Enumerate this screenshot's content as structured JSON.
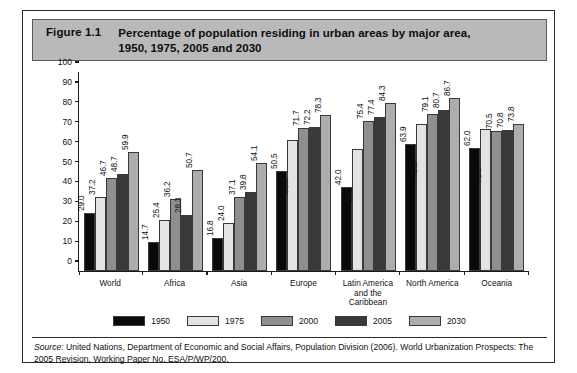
{
  "figure": {
    "number": "Figure 1.1",
    "title_line1": "Percentage of population residing in urban areas by major area,",
    "title_line2": "1950, 1975, 2005 and 2030"
  },
  "source": {
    "label": "Source:",
    "text": " United Nations, Department of Economic and Social Affairs, Population Division (2006). World Urbanization Prospects: The 2005 Revision, Working Paper No. ESA/P/WP/200."
  },
  "chart_data": {
    "type": "bar",
    "title": "Percentage of population residing in urban areas by major area, 1950, 1975, 2005 and 2030",
    "xlabel": "",
    "ylabel": "",
    "ylim": [
      0,
      100
    ],
    "yticks": [
      0,
      10,
      20,
      30,
      40,
      50,
      60,
      70,
      80,
      90,
      100
    ],
    "grid": false,
    "legend_position": "bottom",
    "categories": [
      "World",
      "Africa",
      "Asia",
      "Europe",
      "Latin America and the Caribbean",
      "North America",
      "Oceania"
    ],
    "category_lines": [
      [
        "World"
      ],
      [
        "Africa"
      ],
      [
        "Asia"
      ],
      [
        "Europe"
      ],
      [
        "Latin America",
        "and the",
        "Caribbean"
      ],
      [
        "North America"
      ],
      [
        "Oceania"
      ]
    ],
    "series": [
      {
        "name": "1950",
        "color": "#0a0a0a",
        "values": [
          29.0,
          14.7,
          16.8,
          50.5,
          42.0,
          63.9,
          62.0
        ],
        "labels": [
          "29.0",
          "14.7",
          "16.8",
          "50.5",
          "42.0",
          "63.9",
          "62.0"
        ]
      },
      {
        "name": "1975",
        "color": "#e3e3e3",
        "values": [
          37.2,
          25.4,
          24.0,
          65.6,
          61.2,
          73.8,
          71.5
        ],
        "labels": [
          "37.2",
          "25.4",
          "24.0",
          "35.6",
          "61.2",
          "73.8",
          "71.5"
        ]
      },
      {
        "name": "2000",
        "color": "#8f8f8f",
        "values": [
          46.7,
          36.2,
          37.1,
          71.7,
          75.4,
          79.1,
          70.5
        ],
        "labels": [
          "46.7",
          "36.2",
          "37.1",
          "71.7",
          "75.4",
          "79.1",
          "70.5"
        ]
      },
      {
        "name": "2005",
        "color": "#3a3a3a",
        "values": [
          48.7,
          28.3,
          39.8,
          72.2,
          77.4,
          80.7,
          70.8
        ],
        "labels": [
          "48.7",
          "28.3",
          "39.8",
          "72.2",
          "77.4",
          "80.7",
          "70.8"
        ]
      },
      {
        "name": "2030",
        "color": "#adadad",
        "values": [
          59.9,
          50.7,
          54.1,
          78.3,
          84.3,
          86.7,
          73.8
        ],
        "labels": [
          "59.9",
          "50.7",
          "54.1",
          "78.3",
          "84.3",
          "86.7",
          "73.8"
        ]
      }
    ]
  }
}
